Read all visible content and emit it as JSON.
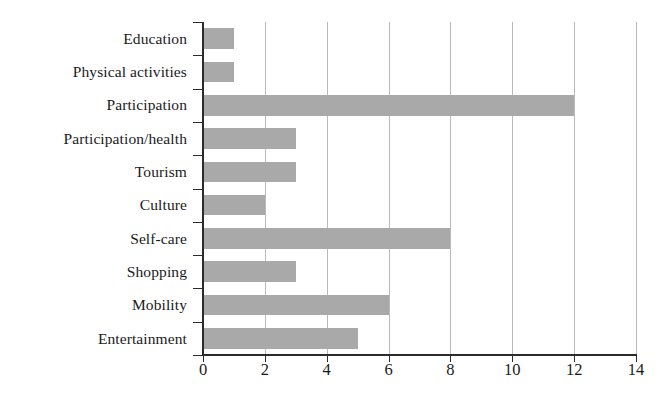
{
  "chart_data": {
    "type": "bar",
    "orientation": "horizontal",
    "title": "",
    "subtitle": "",
    "xlabel": "",
    "ylabel": "",
    "categories": [
      "Education",
      "Physical activities",
      "Participation",
      "Participation/health",
      "Tourism",
      "Culture",
      "Self-care",
      "Shopping",
      "Mobility",
      "Entertainment"
    ],
    "values": [
      1,
      1,
      12,
      3,
      3,
      2,
      8,
      3,
      6,
      5
    ],
    "xlim": [
      0,
      14
    ],
    "xticks": [
      0,
      2,
      4,
      6,
      8,
      10,
      12,
      14
    ],
    "xtick_labels": [
      "0",
      "2",
      "4",
      "6",
      "8",
      "10",
      "12",
      "14"
    ],
    "grid": "vertical",
    "legend": null,
    "bar_color": "#a9a9a9",
    "axis_color": "#2b2b2b",
    "gridline_color": "#b9b9b9"
  }
}
